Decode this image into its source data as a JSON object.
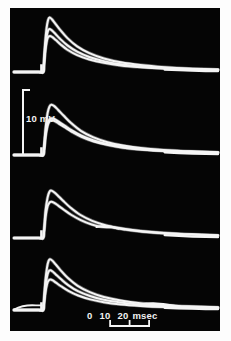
{
  "figure": {
    "background_color": "#fdfdfd",
    "frame_color": "#050505",
    "trace_color": "#f5f5f5"
  },
  "scales": {
    "voltage": {
      "label": "10 mV",
      "value": 10,
      "unit": "mV",
      "orientation": "vertical",
      "bracket_top_y": 90,
      "bracket_bottom_y": 155
    },
    "time": {
      "label": "0  10  20 msec",
      "unit": "msec",
      "ticks": [
        "0",
        "10",
        "20"
      ],
      "tick_values": [
        0,
        10,
        20
      ],
      "orientation": "horizontal"
    }
  },
  "chart_data": {
    "type": "line",
    "xlabel": "msec",
    "ylabel": "mV",
    "xlim": [
      -12,
      72
    ],
    "ylim": [
      -2,
      26
    ],
    "grid": false,
    "legend": "none",
    "panel_count": 4,
    "panels": [
      {
        "name": "panel-1",
        "baseline_mv": 0,
        "stimulus_artifact_ms": 0,
        "series": [
          {
            "name": "trace-1a",
            "peak_mv": 22.5,
            "peak_time_ms": 2.6,
            "x": [
              -12,
              -2,
              0,
              0.3,
              0.8,
              1.4,
              2.0,
              2.6,
              3.6,
              5.0,
              7.0,
              10.0,
              14.0,
              19.0,
              25.0,
              32.0,
              40.0,
              50.0,
              60.0,
              72.0
            ],
            "y": [
              0,
              0,
              0,
              3.0,
              11.5,
              18.0,
              21.4,
              22.5,
              21.8,
              20.0,
              17.4,
              14.0,
              10.6,
              7.8,
              5.6,
              4.0,
              2.9,
              2.0,
              1.4,
              1.0
            ]
          },
          {
            "name": "trace-1b",
            "peak_mv": 17.8,
            "peak_time_ms": 2.6,
            "x": [
              -12,
              -2,
              0,
              0.3,
              0.8,
              1.4,
              2.0,
              2.6,
              3.6,
              5.0,
              7.0,
              10.0,
              14.0,
              19.0,
              25.0,
              32.0,
              40.0,
              50.0,
              60.0,
              72.0
            ],
            "y": [
              0,
              0,
              0,
              2.6,
              9.4,
              14.4,
              17.0,
              17.8,
              17.2,
              15.8,
              13.7,
              11.0,
              8.4,
              6.2,
              4.5,
              3.2,
              2.3,
              1.6,
              1.2,
              0.9
            ]
          },
          {
            "name": "trace-1c",
            "peak_mv": 14.9,
            "peak_time_ms": 2.8,
            "x": [
              -12,
              -2,
              0,
              0.3,
              0.8,
              1.4,
              2.0,
              2.8,
              3.8,
              5.2,
              7.2,
              10.0,
              14.0,
              19.0,
              25.0,
              32.0,
              40.0,
              50.0,
              60.0,
              72.0
            ],
            "y": [
              0,
              0,
              0,
              2.2,
              8.0,
              12.2,
              14.3,
              14.9,
              14.4,
              13.2,
              11.4,
              9.2,
              7.0,
              5.2,
              3.8,
              2.7,
              2.0,
              1.4,
              1.0,
              0.8
            ]
          }
        ]
      },
      {
        "name": "panel-2",
        "baseline_mv": 0,
        "stimulus_artifact_ms": 0,
        "series": [
          {
            "name": "trace-2a",
            "peak_mv": 20.8,
            "peak_time_ms": 3.4,
            "x": [
              -12,
              -2,
              0,
              0.4,
              1.0,
              1.8,
              2.6,
              3.4,
              4.6,
              6.2,
              8.5,
              11.5,
              15.5,
              20.5,
              26.5,
              33.0,
              41.0,
              51.0,
              61.0,
              72.0
            ],
            "y": [
              0,
              0,
              0,
              3.0,
              11.0,
              17.2,
              20.0,
              20.8,
              20.2,
              18.6,
              16.2,
              13.2,
              10.0,
              7.4,
              5.3,
              3.9,
              2.8,
              2.0,
              1.5,
              1.1
            ]
          },
          {
            "name": "trace-2b",
            "peak_mv": 15.2,
            "peak_time_ms": 3.6,
            "x": [
              -12,
              -2,
              0,
              0.4,
              1.0,
              1.8,
              2.6,
              3.6,
              4.8,
              6.4,
              8.8,
              11.8,
              15.8,
              20.8,
              26.8,
              33.0,
              41.0,
              51.0,
              61.0,
              72.0
            ],
            "y": [
              0,
              0,
              0,
              2.4,
              8.4,
              12.8,
              14.7,
              15.2,
              14.8,
              13.8,
              12.2,
              10.2,
              8.0,
              6.0,
              4.4,
              3.3,
              2.4,
              1.7,
              1.3,
              1.0
            ]
          },
          {
            "name": "trace-2c",
            "peak_mv": 14.4,
            "peak_time_ms": 3.6,
            "x": [
              -12,
              -2,
              0,
              0.4,
              1.0,
              1.8,
              2.6,
              3.6,
              4.8,
              6.4,
              8.8,
              11.8,
              15.8,
              20.8,
              26.8,
              33.0,
              41.0,
              51.0,
              61.0,
              72.0
            ],
            "y": [
              0,
              0,
              0,
              2.2,
              7.9,
              12.1,
              13.9,
              14.4,
              14.0,
              13.0,
              11.5,
              9.6,
              7.5,
              5.6,
              4.1,
              3.0,
              2.2,
              1.6,
              1.2,
              0.9
            ]
          }
        ]
      },
      {
        "name": "panel-3",
        "baseline_mv": 0,
        "stimulus_artifact_ms": 0,
        "series": [
          {
            "name": "trace-3a",
            "peak_mv": 19.6,
            "peak_time_ms": 3.2,
            "x": [
              -12,
              -2,
              0,
              0.4,
              1.0,
              1.8,
              2.5,
              3.2,
              4.4,
              6.0,
              8.2,
              11.2,
              15.2,
              20.2,
              26.0,
              33.0,
              41.0,
              51.0,
              61.0,
              72.0
            ],
            "y": [
              0,
              0,
              0,
              3.2,
              11.4,
              16.6,
              18.9,
              19.6,
              19.0,
              17.6,
              15.4,
              12.6,
              9.6,
              7.1,
              5.2,
              3.8,
              2.8,
              2.0,
              1.5,
              1.1
            ]
          },
          {
            "name": "trace-3b",
            "peak_mv": 15.0,
            "peak_time_ms": 3.4,
            "x": [
              -12,
              -2,
              0,
              0.4,
              1.0,
              1.8,
              2.6,
              3.4,
              4.6,
              6.2,
              8.5,
              11.5,
              15.5,
              20.0,
              24.0,
              28.0,
              33.0,
              41.0,
              51.0,
              61.0,
              72.0
            ],
            "y": [
              0,
              0,
              0,
              2.6,
              8.8,
              13.0,
              14.6,
              15.0,
              14.5,
              13.4,
              11.7,
              9.6,
              7.4,
              5.6,
              4.6,
              4.4,
              3.6,
              2.6,
              1.9,
              1.4,
              1.0
            ]
          }
        ]
      },
      {
        "name": "panel-4",
        "baseline_mv": 0,
        "stimulus_artifact_ms": 0,
        "series": [
          {
            "name": "trace-4a",
            "peak_mv": 21.0,
            "peak_time_ms": 2.8,
            "x": [
              -12,
              -2,
              0,
              0.3,
              0.9,
              1.6,
              2.2,
              2.8,
              3.8,
              5.2,
              7.2,
              10.2,
              14.2,
              19.2,
              25.0,
              32.0,
              40.0,
              50.0,
              60.0,
              72.0
            ],
            "y": [
              0,
              0,
              0,
              3.2,
              11.8,
              17.6,
              20.2,
              21.0,
              20.4,
              18.8,
              16.4,
              13.2,
              10.0,
              7.4,
              5.4,
              3.9,
              2.8,
              2.0,
              1.5,
              1.1
            ]
          },
          {
            "name": "trace-4b",
            "peak_mv": 16.4,
            "peak_time_ms": 2.9,
            "x": [
              -12,
              -2,
              0,
              0.3,
              0.9,
              1.6,
              2.2,
              2.9,
              3.9,
              5.3,
              7.3,
              10.3,
              14.3,
              19.3,
              25.0,
              32.0,
              40.0,
              50.0,
              60.0,
              72.0
            ],
            "y": [
              0,
              0,
              0,
              2.6,
              9.2,
              13.8,
              15.8,
              16.4,
              15.9,
              14.6,
              12.8,
              10.3,
              7.8,
              5.8,
              4.2,
              3.1,
              2.2,
              1.6,
              1.2,
              0.9
            ]
          },
          {
            "name": "trace-4c",
            "peak_mv": 12.6,
            "peak_time_ms": 3.0,
            "x": [
              -12,
              -2,
              0,
              0.3,
              0.9,
              1.6,
              2.2,
              3.0,
              4.0,
              5.4,
              7.4,
              10.4,
              14.4,
              19.4,
              25.0,
              32.0,
              40.0,
              50.0,
              60.0,
              72.0
            ],
            "y": [
              0,
              0,
              0,
              2.0,
              7.0,
              10.6,
              12.1,
              12.6,
              12.2,
              11.2,
              9.8,
              7.9,
              6.0,
              4.4,
              3.2,
              2.3,
              1.7,
              1.2,
              0.9,
              0.7
            ]
          }
        ]
      }
    ]
  }
}
